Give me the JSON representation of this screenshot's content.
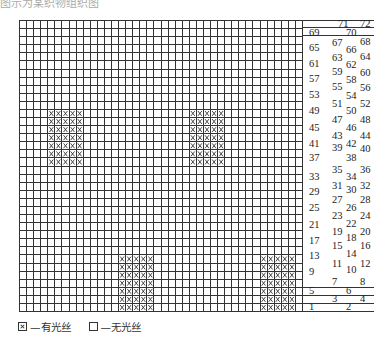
{
  "caption": "图示为某织物组织图",
  "grid": {
    "columns": 40,
    "rows": 36,
    "marked_blocks": [
      {
        "col_start": 4,
        "col_end": 8,
        "row_start": 11,
        "row_end": 17
      },
      {
        "col_start": 24,
        "col_end": 28,
        "row_start": 11,
        "row_end": 17
      },
      {
        "col_start": 14,
        "col_end": 18,
        "row_start": 29,
        "row_end": 35
      },
      {
        "col_start": 34,
        "col_end": 38,
        "row_start": 29,
        "row_end": 35
      }
    ],
    "line_color": "#333333",
    "mark_color": "#333333"
  },
  "sequence_labels": [
    {
      "text": "71",
      "x": 36,
      "y": 0
    },
    {
      "text": "72",
      "x": 58,
      "y": 0
    },
    {
      "text": "69",
      "x": 7,
      "y": 9
    },
    {
      "text": "70",
      "x": 44,
      "y": 9
    },
    {
      "text": "67",
      "x": 30,
      "y": 19
    },
    {
      "text": "68",
      "x": 58,
      "y": 18
    },
    {
      "text": "65",
      "x": 7,
      "y": 24
    },
    {
      "text": "66",
      "x": 44,
      "y": 26
    },
    {
      "text": "63",
      "x": 30,
      "y": 34
    },
    {
      "text": "64",
      "x": 58,
      "y": 33
    },
    {
      "text": "61",
      "x": 7,
      "y": 40
    },
    {
      "text": "62",
      "x": 44,
      "y": 41
    },
    {
      "text": "59",
      "x": 30,
      "y": 48
    },
    {
      "text": "60",
      "x": 58,
      "y": 49
    },
    {
      "text": "57",
      "x": 7,
      "y": 55
    },
    {
      "text": "58",
      "x": 44,
      "y": 56
    },
    {
      "text": "55",
      "x": 30,
      "y": 63
    },
    {
      "text": "56",
      "x": 58,
      "y": 64
    },
    {
      "text": "53",
      "x": 7,
      "y": 71
    },
    {
      "text": "54",
      "x": 44,
      "y": 72
    },
    {
      "text": "51",
      "x": 30,
      "y": 80
    },
    {
      "text": "52",
      "x": 58,
      "y": 80
    },
    {
      "text": "49",
      "x": 7,
      "y": 87
    },
    {
      "text": "50",
      "x": 44,
      "y": 87
    },
    {
      "text": "47",
      "x": 30,
      "y": 96
    },
    {
      "text": "48",
      "x": 58,
      "y": 96
    },
    {
      "text": "45",
      "x": 7,
      "y": 104
    },
    {
      "text": "46",
      "x": 44,
      "y": 104
    },
    {
      "text": "43",
      "x": 30,
      "y": 112
    },
    {
      "text": "44",
      "x": 58,
      "y": 112
    },
    {
      "text": "41",
      "x": 7,
      "y": 120
    },
    {
      "text": "42",
      "x": 44,
      "y": 120
    },
    {
      "text": "39",
      "x": 30,
      "y": 124
    },
    {
      "text": "40",
      "x": 58,
      "y": 125
    },
    {
      "text": "37",
      "x": 7,
      "y": 134
    },
    {
      "text": "38",
      "x": 44,
      "y": 134
    },
    {
      "text": "35",
      "x": 30,
      "y": 146
    },
    {
      "text": "36",
      "x": 58,
      "y": 146
    },
    {
      "text": "33",
      "x": 7,
      "y": 153
    },
    {
      "text": "34",
      "x": 44,
      "y": 153
    },
    {
      "text": "31",
      "x": 30,
      "y": 162
    },
    {
      "text": "32",
      "x": 58,
      "y": 162
    },
    {
      "text": "29",
      "x": 7,
      "y": 168
    },
    {
      "text": "30",
      "x": 44,
      "y": 166
    },
    {
      "text": "27",
      "x": 30,
      "y": 176
    },
    {
      "text": "28",
      "x": 58,
      "y": 176
    },
    {
      "text": "25",
      "x": 7,
      "y": 184
    },
    {
      "text": "26",
      "x": 44,
      "y": 184
    },
    {
      "text": "23",
      "x": 30,
      "y": 192
    },
    {
      "text": "24",
      "x": 58,
      "y": 192
    },
    {
      "text": "21",
      "x": 7,
      "y": 201
    },
    {
      "text": "22",
      "x": 44,
      "y": 200
    },
    {
      "text": "19",
      "x": 30,
      "y": 208
    },
    {
      "text": "20",
      "x": 58,
      "y": 208
    },
    {
      "text": "17",
      "x": 7,
      "y": 217
    },
    {
      "text": "18",
      "x": 44,
      "y": 214
    },
    {
      "text": "15",
      "x": 30,
      "y": 222
    },
    {
      "text": "16",
      "x": 58,
      "y": 222
    },
    {
      "text": "13",
      "x": 7,
      "y": 232
    },
    {
      "text": "14",
      "x": 44,
      "y": 230
    },
    {
      "text": "11",
      "x": 30,
      "y": 240
    },
    {
      "text": "12",
      "x": 58,
      "y": 240
    },
    {
      "text": "9",
      "x": 7,
      "y": 248
    },
    {
      "text": "10",
      "x": 44,
      "y": 246
    },
    {
      "text": "7",
      "x": 30,
      "y": 258
    },
    {
      "text": "8",
      "x": 58,
      "y": 258
    },
    {
      "text": "5",
      "x": 7,
      "y": 267
    },
    {
      "text": "6",
      "x": 44,
      "y": 267
    },
    {
      "text": "3",
      "x": 30,
      "y": 275
    },
    {
      "text": "4",
      "x": 58,
      "y": 275
    },
    {
      "text": "1",
      "x": 7,
      "y": 283
    },
    {
      "text": "2",
      "x": 44,
      "y": 283
    }
  ],
  "label_lines_y": [
    0,
    7,
    15,
    267,
    275,
    283,
    291
  ],
  "legend": {
    "items": [
      {
        "symbol": "cross-box",
        "label": "—有光丝"
      },
      {
        "symbol": "empty-box",
        "label": "—无光丝"
      }
    ]
  }
}
